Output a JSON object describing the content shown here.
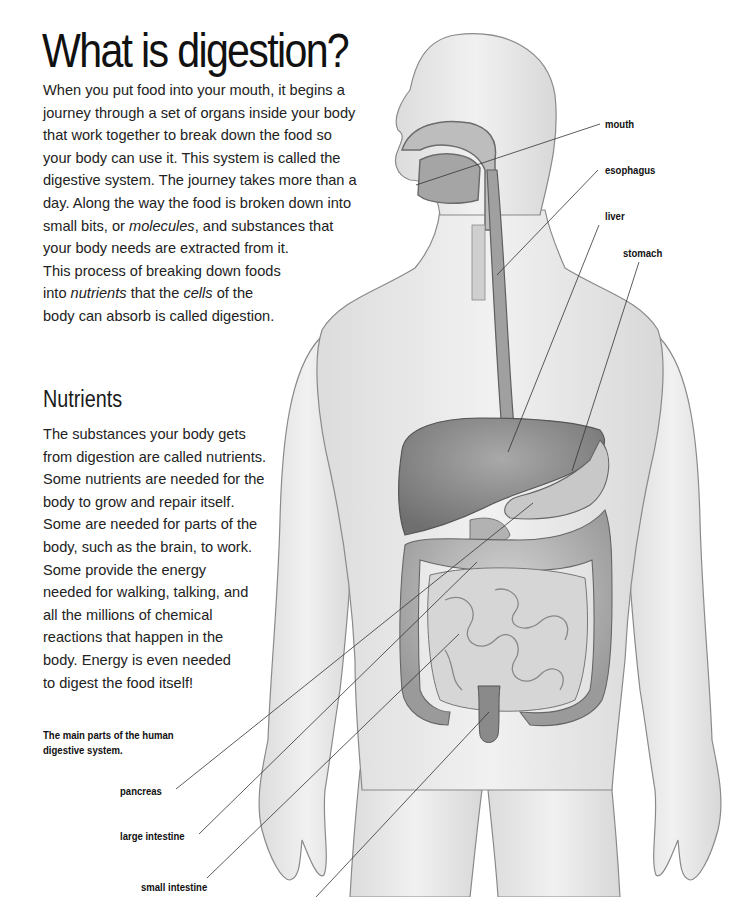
{
  "page": {
    "title": "What is digestion?",
    "intro_lines": [
      {
        "parts": [
          {
            "t": "When you put food into your mouth, it begins a"
          }
        ]
      },
      {
        "parts": [
          {
            "t": "journey through a set of organs inside your body"
          }
        ]
      },
      {
        "parts": [
          {
            "t": "that work together to break down the food so"
          }
        ]
      },
      {
        "parts": [
          {
            "t": "your body can use it. This system is called the"
          }
        ]
      },
      {
        "parts": [
          {
            "t": "digestive system. The journey takes more than a"
          }
        ]
      },
      {
        "parts": [
          {
            "t": "day. Along the way the food is broken down into"
          }
        ]
      },
      {
        "parts": [
          {
            "t": "small bits, or "
          },
          {
            "t": "molecules",
            "i": true
          },
          {
            "t": ", and substances that"
          }
        ]
      },
      {
        "parts": [
          {
            "t": "your body needs are extracted from it."
          }
        ]
      },
      {
        "parts": [
          {
            "t": "This process of breaking down foods"
          }
        ]
      },
      {
        "parts": [
          {
            "t": "into "
          },
          {
            "t": "nutrients",
            "i": true
          },
          {
            "t": " that the "
          },
          {
            "t": "cells",
            "i": true
          },
          {
            "t": " of the"
          }
        ]
      },
      {
        "parts": [
          {
            "t": "body can absorb is called digestion."
          }
        ]
      }
    ],
    "subheading": "Nutrients",
    "nutrients_lines": [
      "The substances your body gets",
      "from digestion are called nutrients.",
      "Some nutrients are needed for the",
      "body to grow and repair itself.",
      "Some are needed for parts of the",
      "body, such as the brain, to work.",
      "Some provide the energy",
      "needed for walking, talking, and",
      "all the millions of chemical",
      "reactions that happen in the",
      "body. Energy is even needed",
      "to digest the food itself!"
    ],
    "caption_lines": [
      "The main parts of the human",
      "digestive system."
    ]
  },
  "diagram": {
    "labels": {
      "mouth": "mouth",
      "esophagus": "esophagus",
      "liver": "liver",
      "stomach": "stomach",
      "pancreas": "pancreas",
      "large_intestine": "large intestine",
      "small_intestine": "small intestine"
    },
    "colors": {
      "skin": "#ececec",
      "outline": "#8a8a8a",
      "organ": "#9c9c9c",
      "organ_dark": "#7d7d7d",
      "organ_light": "#c4c4c4",
      "leader_line": "#333333"
    }
  }
}
